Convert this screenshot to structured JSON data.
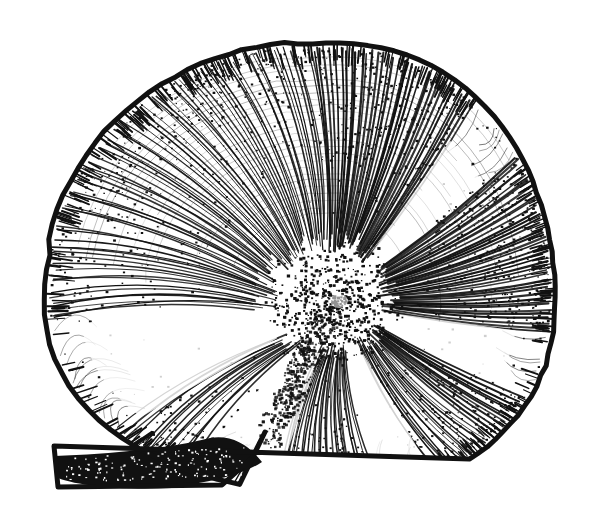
{
  "figure": {
    "kind": "scientific-line-art-illustration",
    "subject_label": "planispiral shell, lateral view",
    "technique": "pen-and-ink hatching with stipple shading",
    "background_color": "#ffffff",
    "ink_color": "#111111",
    "canvas": {
      "width": 601,
      "height": 530
    },
    "caption": "",
    "title": "",
    "labels": [],
    "annotations": []
  },
  "geometry": {
    "outline": {
      "top_y": 43,
      "left_x": 45,
      "right_x": 555,
      "bottom_y": 493,
      "outline_stroke_px": 5,
      "notch_x": 265,
      "notch_y": 432
    },
    "coil_center": {
      "x": 335,
      "y": 305
    },
    "core_radius": 52,
    "aperture_band": {
      "start_x": 52,
      "end_x": 268,
      "top_y": 452,
      "bottom_y": 487,
      "fill": "#111111"
    }
  },
  "shading": {
    "radial_line_count": 300,
    "stipple_count": 2600,
    "dense_rim_sectors_deg": [
      [
        -95,
        -15
      ],
      [
        -15,
        40
      ]
    ],
    "pale_band_sectors_deg": [
      [
        108,
        132
      ],
      [
        150,
        176
      ],
      [
        -55,
        -40
      ],
      [
        8,
        26
      ],
      [
        60,
        76
      ]
    ],
    "core_stipple_count": 900
  },
  "palette": {
    "ink": "#111111",
    "paper": "#ffffff",
    "mid_ink": "#1b1b1b"
  }
}
